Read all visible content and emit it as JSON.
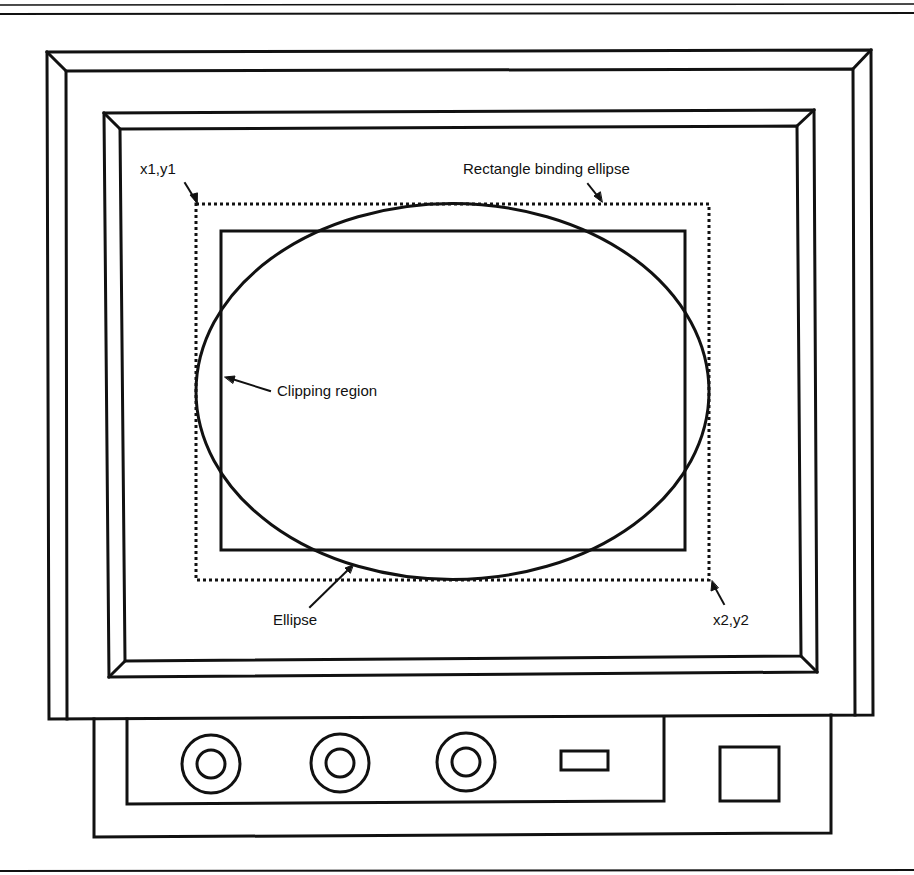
{
  "diagram": {
    "colors": {
      "line": "#111111",
      "background": "#ffffff"
    },
    "labels": {
      "top_left_corner": "x1,y1",
      "bounding_rect": "Rectangle binding ellipse",
      "clipping_region": "Clipping region",
      "ellipse": "Ellipse",
      "bottom_right_corner": "x2,y2"
    },
    "geometry": {
      "bounding_rect": {
        "x1": 196,
        "y1": 204,
        "x2": 709,
        "y2": 580
      },
      "clipping_rect": {
        "x1": 221,
        "y1": 231,
        "x2": 685,
        "y2": 550
      },
      "ellipse": {
        "cx": 452.5,
        "cy": 391.5,
        "rx": 256.5,
        "ry": 188
      }
    },
    "monitor": {
      "controls": {
        "knobs": [
          {
            "name": "knob-1",
            "cx": 211,
            "cy": 764
          },
          {
            "name": "knob-2",
            "cx": 340,
            "cy": 763
          },
          {
            "name": "knob-3",
            "cx": 466,
            "cy": 762
          }
        ],
        "slot": {
          "x": 561,
          "y": 751,
          "w": 47,
          "h": 19
        },
        "power_button": {
          "x": 720,
          "y": 747,
          "w": 59,
          "h": 54
        }
      }
    }
  }
}
